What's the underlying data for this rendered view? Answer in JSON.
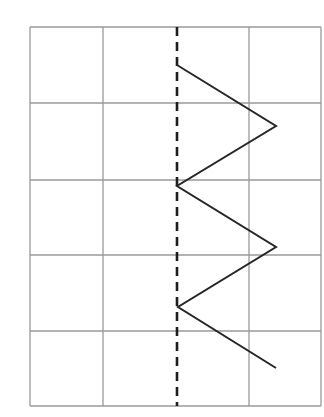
{
  "diagram": {
    "type": "symmetry-grid",
    "grid": {
      "columns": 4,
      "rows": 5,
      "x_lines": [
        30,
        103,
        177,
        249,
        321
      ],
      "y_lines": [
        27,
        103,
        180,
        255,
        331,
        406
      ],
      "line_color": "#9a9a9a"
    },
    "axis_of_symmetry": {
      "style": "dashed",
      "x": 177,
      "y_start": 27,
      "y_end": 406,
      "color": "#1e1e1e"
    },
    "zigzag": {
      "color": "#262626",
      "points": [
        [
          177,
          65
        ],
        [
          276,
          126
        ],
        [
          177,
          186
        ],
        [
          276,
          247
        ],
        [
          178,
          307
        ],
        [
          276,
          368
        ]
      ]
    }
  }
}
